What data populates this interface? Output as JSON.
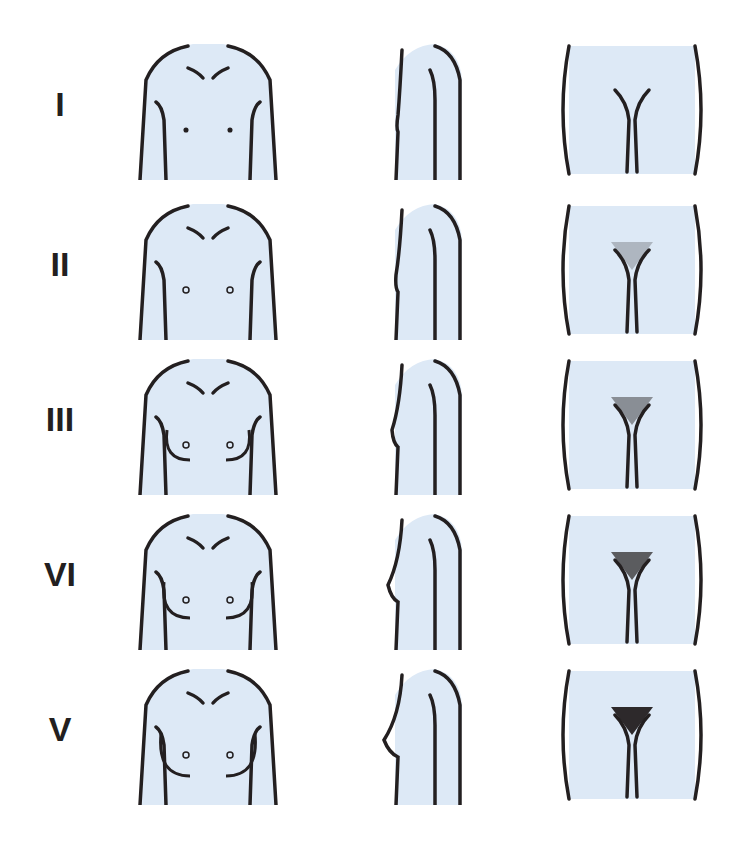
{
  "figure": {
    "bg_color": "#ffffff",
    "panel_fill": "#dde9f6",
    "stroke_color": "#231f20",
    "rows": [
      {
        "label": "I",
        "stage": 1,
        "top": 40
      },
      {
        "label": "II",
        "stage": 2,
        "top": 200
      },
      {
        "label": "III",
        "stage": 3,
        "top": 355
      },
      {
        "label": "VI",
        "stage": 4,
        "top": 510
      },
      {
        "label": "V",
        "stage": 5,
        "top": 665
      }
    ],
    "columns": [
      "front-view",
      "side-view",
      "pelvic-view"
    ]
  }
}
